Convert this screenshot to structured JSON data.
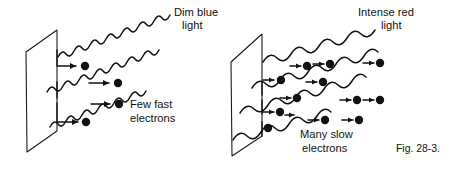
{
  "figure": {
    "caption": "Fig. 28-3.",
    "panels": [
      {
        "id": "left",
        "light_label_line1": "Dim blue",
        "light_label_line2": "light",
        "result_label_line1": "Few fast",
        "result_label_line2": "electrons",
        "light_color_name": "blue",
        "intensity": "dim",
        "wavelength": "short",
        "electron_count": 3,
        "electron_speed": "fast",
        "wave_count": 3
      },
      {
        "id": "right",
        "light_label_line1": "Intense red",
        "light_label_line2": "light",
        "result_label_line1": "Many slow",
        "result_label_line2": "electrons",
        "light_color_name": "red",
        "intensity": "intense",
        "wavelength": "long",
        "electron_count": 13,
        "electron_speed": "slow",
        "wave_count": 5
      }
    ],
    "colors": {
      "ink": "#111111",
      "plate_stroke": "#1a1a1a",
      "background": "#ffffff"
    }
  }
}
